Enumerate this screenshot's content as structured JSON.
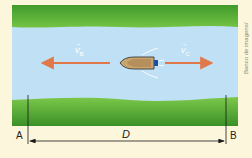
{
  "figure": {
    "credit_line1": "Banco de imagens/",
    "credit_line2": "Arquivo da editora",
    "labels": {
      "left_point": "A",
      "right_point": "B",
      "distance": "D",
      "boat_velocity": "v",
      "boat_velocity_sub": "B",
      "current_velocity": "v",
      "current_velocity_sub": "C"
    },
    "colors": {
      "background": "#fcf6dc",
      "grass_light": "#6cbf3a",
      "grass_dark": "#3f9a2b",
      "river": "#bfe0f5",
      "arrow": "#e0784a",
      "boat_hull": "#c9a56e",
      "boat_motor": "#1f4fa0",
      "line": "#1a1a1a"
    }
  }
}
